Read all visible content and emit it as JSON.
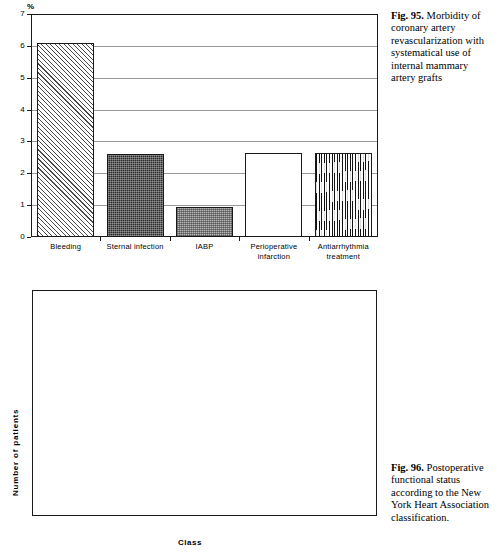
{
  "figures": [
    {
      "id": "fig95",
      "caption_label": "Fig. 95.",
      "caption_text": " Morbidity of coronary artery revascularization with systematical use of internal mammary artery grafts",
      "chart_data": {
        "type": "bar",
        "title": "",
        "xlabel": "",
        "ylabel": "%",
        "ylim": [
          0,
          7
        ],
        "yticks": [
          0,
          1,
          2,
          3,
          4,
          5,
          6,
          7
        ],
        "grid": true,
        "categories": [
          "Bleeding",
          "Sternal infection",
          "IABP",
          "Perioperative infarction",
          "Antiarrhythmia treatment"
        ],
        "values": [
          6.1,
          2.6,
          0.95,
          2.65,
          2.65
        ],
        "fills": [
          "hatch-diagonal",
          "dark-stipple",
          "light-stipple",
          "none",
          "wavy-vertical"
        ]
      }
    },
    {
      "id": "fig96",
      "caption_label": "Fig. 96.",
      "caption_text": " Postoperative functional status according to the New York Heart Association classification.",
      "chart_data": {
        "type": "bar",
        "title": "",
        "xlabel": "Class",
        "ylabel": "Number of patients",
        "ylim": [
          0,
          80
        ],
        "yticks": [
          0,
          10,
          20,
          30,
          40,
          50,
          60,
          70,
          80
        ],
        "grid": true,
        "categories": [
          "I",
          "II",
          "III",
          "IV"
        ],
        "values": [
          72,
          16.5,
          1.5,
          0
        ],
        "fills": [
          "checker",
          "checker",
          "checker",
          "checker"
        ]
      }
    }
  ]
}
